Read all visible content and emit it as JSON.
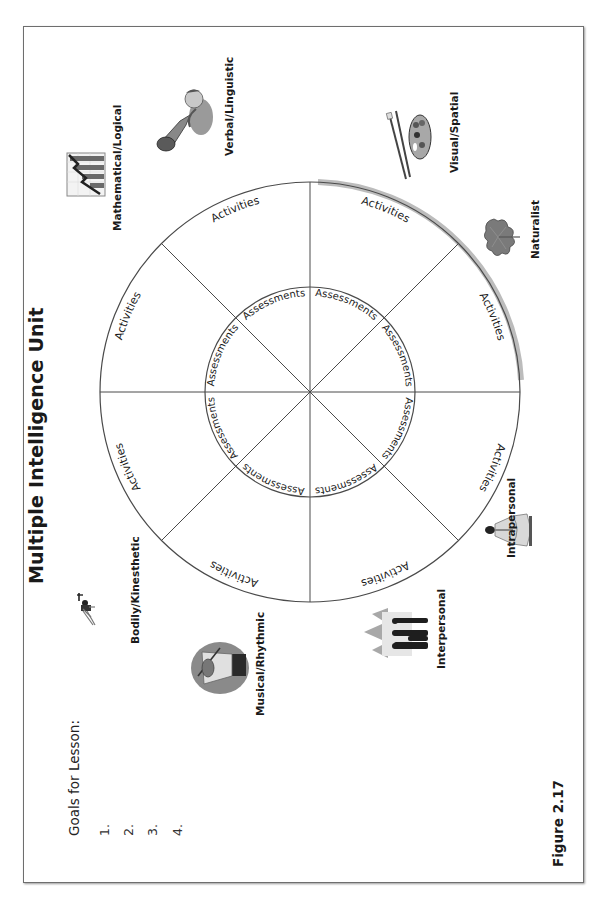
{
  "page": {
    "title": "Multiple Intelligence Unit",
    "figure_label": "Figure 2.17"
  },
  "goals": {
    "heading": "Goals for Lesson:",
    "items": [
      "1.",
      "2.",
      "3.",
      "4."
    ]
  },
  "wheel": {
    "sector_count": 8,
    "outer_label": "Activities",
    "inner_label": "Assessments",
    "shadow_color": "#b8b8b8",
    "line_color": "#4a4a4a"
  },
  "intelligences": [
    {
      "label": "Mathematical/Logical",
      "icon": "bar-chart-icon"
    },
    {
      "label": "Verbal/Linguistic",
      "icon": "megaphone-icon"
    },
    {
      "label": "Visual/Spatial",
      "icon": "paint-palette-icon"
    },
    {
      "label": "Naturalist",
      "icon": "leaf-icon"
    },
    {
      "label": "Intrapersonal",
      "icon": "meditation-icon"
    },
    {
      "label": "Interpersonal",
      "icon": "group-people-icon"
    },
    {
      "label": "Musical/Rhythmic",
      "icon": "violinist-icon"
    },
    {
      "label": "Bodily/Kinesthetic",
      "icon": "weightlifter-icon"
    }
  ]
}
